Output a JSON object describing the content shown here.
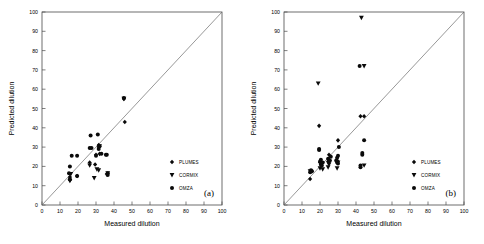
{
  "figure": {
    "background": "#ffffff",
    "ink": "#000000",
    "axis_color": "#4a4a4a",
    "diagonal_color": "#6b6b6b",
    "marker_color": "#0a0a0a"
  },
  "legend": {
    "position": "inside-right",
    "entries": [
      {
        "label": "PLUMES",
        "marker": "diamond-marker"
      },
      {
        "label": "CORMIX",
        "marker": "down-triangle-marker"
      },
      {
        "label": "OMZA",
        "marker": "circle-marker"
      }
    ]
  },
  "axis": {
    "xlabel": "Measured dilution",
    "ylabel": "Predicted dilution",
    "ticks": [
      0,
      10,
      20,
      30,
      40,
      50,
      60,
      70,
      80,
      90,
      100
    ],
    "tick_labels": [
      "0",
      "10",
      "20",
      "30",
      "40",
      "50",
      "60",
      "70",
      "80",
      "90",
      "100"
    ],
    "xlim": [
      0,
      100
    ],
    "ylim": [
      0,
      100
    ]
  },
  "chart_data": [
    {
      "type": "scatter",
      "panel": "(a)",
      "title": "",
      "xlabel": "Measured dilution",
      "ylabel": "Predicted dilution",
      "xlim": [
        0,
        100
      ],
      "ylim": [
        0,
        100
      ],
      "grid": false,
      "legend_position": "inside-right",
      "reference_line": {
        "type": "1:1",
        "from": [
          0,
          0
        ],
        "to": [
          100,
          100
        ]
      },
      "series": [
        {
          "name": "PLUMES",
          "marker": "diamond",
          "points": [
            [
              15.5,
              13.0
            ],
            [
              15.5,
              14.5
            ],
            [
              19.5,
              15.0
            ],
            [
              26.5,
              22.0
            ],
            [
              29.5,
              21.0
            ],
            [
              30.0,
              26.0
            ],
            [
              31.5,
              30.0
            ],
            [
              31.5,
              31.0
            ],
            [
              32.0,
              26.5
            ],
            [
              36.0,
              16.0
            ],
            [
              45.5,
              55.0
            ],
            [
              46.0,
              43.0
            ]
          ]
        },
        {
          "name": "CORMIX",
          "marker": "down-triangle",
          "points": [
            [
              15.5,
              12.5
            ],
            [
              16.0,
              16.0
            ],
            [
              26.5,
              20.5
            ],
            [
              29.0,
              14.0
            ],
            [
              30.5,
              18.5
            ],
            [
              31.5,
              18.0
            ],
            [
              32.0,
              30.5
            ],
            [
              36.5,
              16.5
            ],
            [
              45.5,
              55.0
            ]
          ]
        },
        {
          "name": "OMZA",
          "marker": "circle",
          "points": [
            [
              15.0,
              16.5
            ],
            [
              15.5,
              13.5
            ],
            [
              15.5,
              20.0
            ],
            [
              16.5,
              25.5
            ],
            [
              19.5,
              15.0
            ],
            [
              19.5,
              25.5
            ],
            [
              26.5,
              29.5
            ],
            [
              27.0,
              36.0
            ],
            [
              27.5,
              29.5
            ],
            [
              30.0,
              25.5
            ],
            [
              31.0,
              36.5
            ],
            [
              31.5,
              29.0
            ],
            [
              32.0,
              30.5
            ],
            [
              33.0,
              26.5
            ],
            [
              35.5,
              26.0
            ],
            [
              36.0,
              26.0
            ],
            [
              36.5,
              16.5
            ],
            [
              36.5,
              15.5
            ],
            [
              45.5,
              55.5
            ]
          ]
        }
      ]
    },
    {
      "type": "scatter",
      "panel": "(b)",
      "title": "",
      "xlabel": "Measured dilution",
      "ylabel": "Predicted dilution",
      "xlim": [
        0,
        100
      ],
      "ylim": [
        0,
        100
      ],
      "grid": false,
      "legend_position": "inside-right",
      "reference_line": {
        "type": "1:1",
        "from": [
          0,
          0
        ],
        "to": [
          100,
          100
        ]
      },
      "series": [
        {
          "name": "PLUMES",
          "marker": "diamond",
          "points": [
            [
              14.5,
              13.5
            ],
            [
              15.5,
              17.5
            ],
            [
              19.5,
              41.0
            ],
            [
              20.0,
              22.0
            ],
            [
              21.0,
              21.5
            ],
            [
              24.5,
              22.5
            ],
            [
              25.0,
              26.0
            ],
            [
              29.5,
              23.0
            ],
            [
              30.0,
              33.5
            ],
            [
              42.5,
              46.0
            ],
            [
              44.5,
              46.0
            ]
          ]
        },
        {
          "name": "CORMIX",
          "marker": "down-triangle",
          "points": [
            [
              14.5,
              17.5
            ],
            [
              19.0,
              63.0
            ],
            [
              20.0,
              19.0
            ],
            [
              21.5,
              18.5
            ],
            [
              24.5,
              19.5
            ],
            [
              25.0,
              21.0
            ],
            [
              29.5,
              19.0
            ],
            [
              30.0,
              22.0
            ],
            [
              43.0,
              97.0
            ],
            [
              44.5,
              72.0
            ],
            [
              44.5,
              20.5
            ]
          ]
        },
        {
          "name": "OMZA",
          "marker": "circle",
          "points": [
            [
              14.5,
              17.0
            ],
            [
              15.0,
              18.0
            ],
            [
              15.5,
              17.5
            ],
            [
              19.5,
              28.5
            ],
            [
              19.5,
              29.0
            ],
            [
              20.0,
              22.5
            ],
            [
              20.5,
              21.0
            ],
            [
              20.5,
              23.5
            ],
            [
              21.0,
              20.5
            ],
            [
              21.5,
              22.0
            ],
            [
              24.5,
              24.0
            ],
            [
              25.0,
              22.5
            ],
            [
              25.5,
              23.0
            ],
            [
              26.0,
              25.0
            ],
            [
              29.0,
              23.0
            ],
            [
              29.5,
              24.5
            ],
            [
              29.5,
              22.0
            ],
            [
              30.0,
              25.5
            ],
            [
              30.0,
              21.5
            ],
            [
              30.5,
              30.0
            ],
            [
              42.5,
              19.5
            ],
            [
              42.5,
              20.5
            ],
            [
              43.5,
              26.0
            ],
            [
              43.5,
              27.0
            ],
            [
              44.5,
              33.5
            ],
            [
              42.0,
              72.0
            ]
          ]
        }
      ]
    }
  ]
}
